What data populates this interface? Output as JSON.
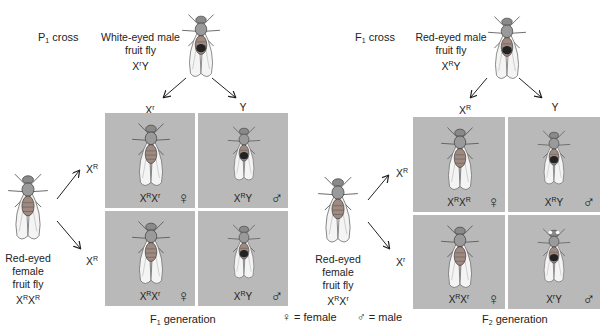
{
  "p1": {
    "cross_label": "P",
    "cross_sub": "1",
    "cross_suffix": " cross",
    "male": {
      "line1": "White-eyed male",
      "line2": "fruit fly",
      "geno_base": "X",
      "geno_sup": "r",
      "geno_tail": "Y"
    },
    "female": {
      "line1": "Red-eyed",
      "line2": "female",
      "line3": "fruit fly",
      "geno": [
        {
          "b": "X",
          "s": "R"
        },
        {
          "b": "X",
          "s": "R"
        }
      ]
    },
    "col_headers": [
      {
        "b": "X",
        "s": "r"
      },
      {
        "b": "Y",
        "s": ""
      }
    ],
    "row_headers": [
      {
        "b": "X",
        "s": "R"
      },
      {
        "b": "X",
        "s": "R"
      }
    ],
    "cells": [
      {
        "g1": "X",
        "s1": "R",
        "g2": "X",
        "s2": "r",
        "sex": "♀",
        "sex_name": "female"
      },
      {
        "g1": "X",
        "s1": "R",
        "g2": "Y",
        "s2": "",
        "sex": "♂",
        "sex_name": "male"
      },
      {
        "g1": "X",
        "s1": "R",
        "g2": "X",
        "s2": "r",
        "sex": "♀",
        "sex_name": "female"
      },
      {
        "g1": "X",
        "s1": "R",
        "g2": "Y",
        "s2": "",
        "sex": "♂",
        "sex_name": "male"
      }
    ],
    "generation_label": "F",
    "generation_sub": "1",
    "generation_suffix": " generation"
  },
  "f1": {
    "cross_label": "F",
    "cross_sub": "1",
    "cross_suffix": " cross",
    "male": {
      "line1": "Red-eyed male",
      "line2": "fruit fly",
      "geno_base": "X",
      "geno_sup": "R",
      "geno_tail": "Y"
    },
    "female": {
      "line1": "Red-eyed",
      "line2": "female",
      "line3": "fruit fly",
      "geno": [
        {
          "b": "X",
          "s": "R"
        },
        {
          "b": "X",
          "s": "r"
        }
      ]
    },
    "col_headers": [
      {
        "b": "X",
        "s": "R"
      },
      {
        "b": "Y",
        "s": ""
      }
    ],
    "row_headers": [
      {
        "b": "X",
        "s": "R"
      },
      {
        "b": "X",
        "s": "r"
      }
    ],
    "cells": [
      {
        "g1": "X",
        "s1": "R",
        "g2": "X",
        "s2": "R",
        "sex": "♀",
        "sex_name": "female"
      },
      {
        "g1": "X",
        "s1": "R",
        "g2": "Y",
        "s2": "",
        "sex": "♂",
        "sex_name": "male"
      },
      {
        "g1": "X",
        "s1": "R",
        "g2": "X",
        "s2": "r",
        "sex": "♀",
        "sex_name": "female"
      },
      {
        "g1": "X",
        "s1": "r",
        "g2": "Y",
        "s2": "",
        "sex": "♂",
        "sex_name": "male"
      }
    ],
    "generation_label": "F",
    "generation_sub": "2",
    "generation_suffix": " generation"
  },
  "legend": {
    "female_symbol": "♀",
    "female_text": "= female",
    "male_symbol": "♂",
    "male_text": "= male"
  },
  "colors": {
    "cell_bg": "#b9b9b9",
    "text": "#222222",
    "background": "#ffffff"
  }
}
